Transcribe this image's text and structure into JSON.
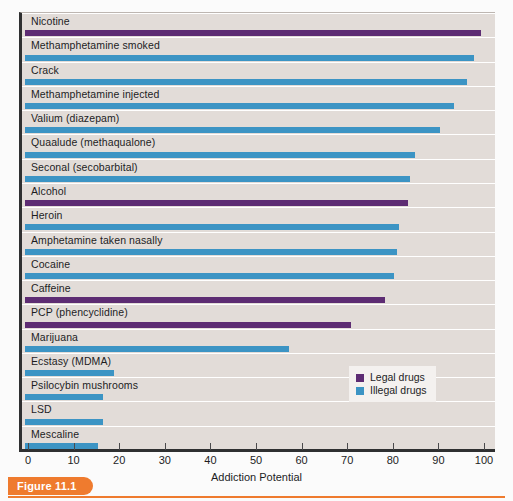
{
  "figure": {
    "badge_label": "Figure 11.1",
    "x_axis_title": "Addiction Potential"
  },
  "legend": {
    "position": "inside-lower-right",
    "items": [
      {
        "label": "Legal drugs",
        "color": "#5d2c73",
        "key": "legal"
      },
      {
        "label": "Illegal drugs",
        "color": "#3c94c4",
        "key": "illegal"
      }
    ]
  },
  "axis": {
    "ticks": [
      "0",
      "10",
      "20",
      "30",
      "40",
      "50",
      "60",
      "70",
      "80",
      "90",
      "100"
    ],
    "min": 0,
    "max": 100
  },
  "chart_data": {
    "type": "bar",
    "orientation": "horizontal",
    "title": "",
    "subtitle": "",
    "xlabel": "Addiction Potential",
    "ylabel": "",
    "xlim": [
      0,
      100
    ],
    "grid": false,
    "legend_position": "inside-lower-right",
    "categories": [
      "Nicotine",
      "Methamphetamine smoked",
      "Crack",
      "Methamphetamine injected",
      "Valium (diazepam)",
      "Quaalude (methaqualone)",
      "Seconal (secobarbital)",
      "Alcohol",
      "Heroin",
      "Amphetamine taken nasally",
      "Cocaine",
      "Caffeine",
      "PCP (phencyclidine)",
      "Marijuana",
      "Ecstasy (MDMA)",
      "Psilocybin mushrooms",
      "LSD",
      "Mescaline"
    ],
    "values": [
      100,
      98.5,
      97,
      94,
      91,
      85.5,
      84.5,
      84,
      82,
      81.5,
      81,
      79,
      71.5,
      58,
      19.5,
      17,
      17,
      16
    ],
    "groups": [
      "legal",
      "illegal",
      "illegal",
      "illegal",
      "illegal",
      "illegal",
      "illegal",
      "legal",
      "illegal",
      "illegal",
      "illegal",
      "legal",
      "legal",
      "illegal",
      "illegal",
      "illegal",
      "illegal",
      "illegal"
    ],
    "series": [
      {
        "name": "Legal drugs",
        "color": "#5d2c73"
      },
      {
        "name": "Illegal drugs",
        "color": "#3c94c4"
      }
    ]
  },
  "colors": {
    "plot_background": "#e2dcd8",
    "legal": "#5d2c73",
    "illegal": "#3c94c4",
    "axis": "#2f3031",
    "badge": "#ef7b2e"
  }
}
